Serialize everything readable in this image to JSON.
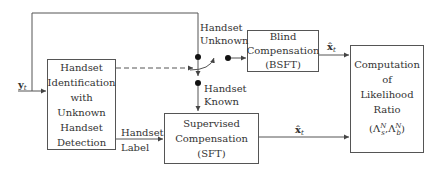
{
  "diagram": {
    "type": "block-diagram",
    "blocks": {
      "identification": {
        "lines": [
          "Handset",
          "Identification",
          "with",
          "Unknown",
          "Handset",
          "Detection"
        ]
      },
      "blind": {
        "lines": [
          "Blind",
          "Compensation",
          "(BSFT)"
        ]
      },
      "supervised": {
        "lines": [
          "Supervised",
          "Compensation",
          "(SFT)"
        ]
      },
      "likelihood": {
        "lines": [
          "Computation",
          "of",
          "Likelihood",
          "Ratio"
        ],
        "formula": {
          "open": "(Λ",
          "s_sup": "N",
          "s_sub": "s",
          "sep": ",Λ",
          "b_sup": "N",
          "b_sub": "b",
          "close": ")"
        }
      }
    },
    "labels": {
      "input": {
        "base": "y",
        "sub": "t"
      },
      "handset_unknown": [
        "Handset",
        "Unknown"
      ],
      "handset_known": [
        "Handset",
        "Known"
      ],
      "handset_label": [
        "Handset",
        "Label"
      ],
      "output_blind": {
        "base": "x̂",
        "sub": "t"
      },
      "output_supervised": {
        "base": "x̂",
        "sub": "t"
      }
    },
    "colors": {
      "line": "#555555",
      "text": "#333333",
      "background": "#ffffff"
    }
  }
}
